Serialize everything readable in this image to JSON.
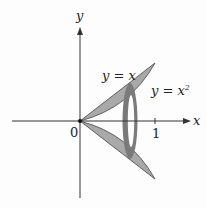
{
  "diagram": {
    "type": "solid-of-revolution",
    "axes": {
      "x_label": "x",
      "y_label": "y",
      "origin_label": "0",
      "x_tick_label": "1"
    },
    "curves": {
      "upper_label": "y = x",
      "lower_label_base": "y = x",
      "lower_label_exponent": "2"
    },
    "colors": {
      "region_fill": "#a9a9a9",
      "washer_fill": "#7a7a7a",
      "axis": "#333333",
      "outline": "#444444"
    }
  }
}
